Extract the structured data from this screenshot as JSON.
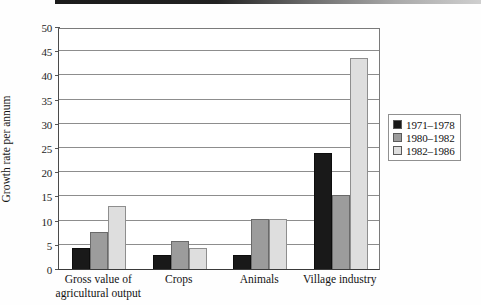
{
  "chart_data": {
    "type": "bar",
    "title": "",
    "xlabel": "",
    "ylabel": "Growth rate per annum",
    "ylim": [
      0,
      50
    ],
    "ytick_step": 5,
    "yticks": [
      0,
      5,
      10,
      15,
      20,
      25,
      30,
      35,
      40,
      45,
      50
    ],
    "grid": "horizontal",
    "legend_position": "right",
    "categories": [
      "Gross value of agricultural output",
      "Crops",
      "Animals",
      "Village industry"
    ],
    "category_label_lines": [
      [
        "Gross value of",
        "agricultural output"
      ],
      [
        "Crops"
      ],
      [
        "Animals"
      ],
      [
        "Village industry"
      ]
    ],
    "series": [
      {
        "name": "1971–1978",
        "color": "#191919",
        "values": [
          4.3,
          2.8,
          2.8,
          24.0
        ]
      },
      {
        "name": "1980–1982",
        "color": "#9c9c9c",
        "values": [
          7.6,
          5.7,
          10.4,
          15.3
        ]
      },
      {
        "name": "1982–1986",
        "color": "#dedede",
        "values": [
          13.0,
          4.4,
          10.4,
          43.5
        ]
      }
    ]
  },
  "figure": {
    "background_color": "#ffffff",
    "axis_color": "#3a3a3a",
    "gridline_color": "#8d8d8d",
    "scan_band": ""
  }
}
